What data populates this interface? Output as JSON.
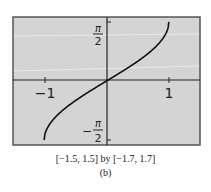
{
  "chart_data": {
    "type": "line",
    "function": "y = arcsin(x)",
    "x": [
      -1.0,
      -0.9,
      -0.75,
      -0.5,
      -0.25,
      0.0,
      0.25,
      0.5,
      0.75,
      0.9,
      1.0
    ],
    "series": [
      {
        "name": "arcsin(x)",
        "values": [
          -1.5708,
          -1.1198,
          -0.8481,
          -0.5236,
          -0.2527,
          0.0,
          0.2527,
          0.5236,
          0.8481,
          1.1198,
          1.5708
        ]
      }
    ],
    "xlim": [
      -1.5,
      1.5
    ],
    "ylim": [
      -1.7,
      1.7
    ],
    "x_tick_labels": [
      "-1",
      "1"
    ],
    "y_tick_labels": [
      "π/2",
      "−π/2"
    ],
    "title": "",
    "xlabel": "",
    "ylabel": "",
    "grid": false,
    "legend": null
  },
  "caption": {
    "window": "[−1.5, 1.5] by [−1.7, 1.7]",
    "label": "(b)"
  },
  "colors": {
    "plot_background": "#d4d4d4",
    "frame": "#555555",
    "axes": "#222222",
    "curve": "#111111"
  },
  "labels": {
    "x_neg_one": "−1",
    "x_one": "1",
    "y_pi": "π",
    "y_two": "2",
    "y_minus": "−"
  }
}
